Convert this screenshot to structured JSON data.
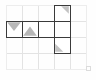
{
  "figure": {
    "canvas": {
      "width": 96,
      "height": 80,
      "background": "#fefefe"
    },
    "grid": {
      "label": "background-grid",
      "origin_x": 6,
      "origin_y": 5,
      "cell_size": 16,
      "cols": 5,
      "rows": 4,
      "line_color": "#e3e3e3",
      "line_width": 1,
      "outer_border_color": "#ededed"
    },
    "piece": {
      "label": "shaded-polyomino",
      "outline_color": "#3a3a3a",
      "outline_width": 1.6,
      "fill_color": "#ffffff",
      "shade_color": "#9b9b9b",
      "cells": [
        {
          "name": "cell-row2-col1",
          "col": 1,
          "row": 2,
          "shade": "triangle-down-top",
          "shade_opacity": 0.72
        },
        {
          "name": "cell-row2-col2",
          "col": 2,
          "row": 2,
          "shade": "triangle-up-bottom",
          "shade_opacity": 0.72
        },
        {
          "name": "cell-row2-col3",
          "col": 3,
          "row": 2,
          "shade": "none",
          "shade_opacity": 0
        },
        {
          "name": "cell-row1-col4",
          "col": 4,
          "row": 1,
          "shade": "triangle-corner-top-right",
          "shade_opacity": 0.6
        },
        {
          "name": "cell-row2-col4",
          "col": 4,
          "row": 2,
          "shade": "none",
          "shade_opacity": 0
        },
        {
          "name": "cell-row3-col4",
          "col": 4,
          "row": 3,
          "shade": "triangle-corner-bottom-left",
          "shade_opacity": 0.6
        }
      ]
    },
    "watermark": {
      "label": "corner-mark",
      "text": "",
      "x": 88,
      "y": 70,
      "color": "#dcdcdc"
    }
  },
  "chart_data": {
    "type": "heatmap",
    "xlabel": "",
    "ylabel": "",
    "grid": true,
    "legend": "none",
    "categories_x": [
      "1",
      "2",
      "3",
      "4",
      "5"
    ],
    "categories_y": [
      "1",
      "2",
      "3",
      "4"
    ],
    "values": [
      [
        0,
        0,
        0,
        1,
        0
      ],
      [
        1,
        1,
        1,
        1,
        0
      ],
      [
        0,
        0,
        0,
        1,
        0
      ],
      [
        0,
        0,
        0,
        0,
        0
      ]
    ],
    "shading": [
      [
        "",
        "",
        "",
        "corner-top-right",
        ""
      ],
      [
        "triangle-down-top",
        "triangle-up-bottom",
        "",
        "",
        ""
      ],
      [
        "",
        "",
        "",
        "corner-bottom-left",
        ""
      ],
      [
        "",
        "",
        "",
        "",
        ""
      ]
    ]
  }
}
